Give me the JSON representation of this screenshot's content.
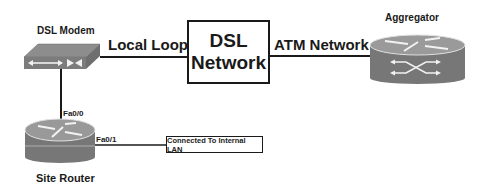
{
  "diagram": {
    "nodes": {
      "dsl_modem": {
        "label": "DSL Modem",
        "icon": "dsl-modem-icon"
      },
      "dsl_network": {
        "line1": "DSL",
        "line2": "Network"
      },
      "aggregator": {
        "label": "Aggregator",
        "icon": "router-icon"
      },
      "site_router": {
        "label": "Site Router",
        "icon": "router-icon"
      },
      "internal_lan": {
        "label": "Connected To Internal LAN"
      }
    },
    "links": {
      "local_loop": {
        "label": "Local Loop",
        "from": "DSL Modem",
        "to": "DSL Network"
      },
      "atm_network": {
        "label": "ATM Network",
        "from": "DSL Network",
        "to": "Aggregator"
      },
      "modem_router": {
        "label": "Fa0/0",
        "from": "DSL Modem",
        "to": "Site Router"
      },
      "router_lan": {
        "label": "Fa0/1",
        "from": "Site Router",
        "to": "Connected To Internal LAN"
      }
    },
    "colors": {
      "line": "#1a1a1a",
      "device_body": "#7a7a7a",
      "device_top": "#9a9a9a",
      "device_arrows": "#f2f2f2"
    }
  }
}
